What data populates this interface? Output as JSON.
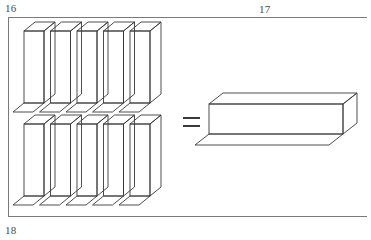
{
  "page": {
    "width": 371,
    "height": 240,
    "background_color": "#ffffff",
    "ink_color": "#3a3a3a",
    "label_color": "#4a4a4a"
  },
  "labels": {
    "top_left": "16",
    "top_center": "17",
    "bottom_left": "18"
  },
  "frame": {
    "name": "page-frame",
    "left": 8,
    "top": 17,
    "right": 367,
    "bottom": 216,
    "stroke": "#7a7a7a",
    "stroke_width": 1,
    "sides_drawn": [
      "top",
      "left",
      "bottom"
    ]
  },
  "figure": {
    "equals_sign": {
      "name": "equals-sign",
      "x": 183,
      "y": 117,
      "bar_width": 17,
      "bar_height": 2,
      "bar_gap": 6
    },
    "tall_prisms": {
      "count": 10,
      "rows": 2,
      "per_row": 5,
      "row_tops": [
        31,
        124
      ],
      "first_left": 24,
      "pitch": 26.5,
      "front_width": 20,
      "front_height": 72,
      "depth_dx": 11,
      "depth_dy": -9
    },
    "long_prism": {
      "name": "long-horizontal-prism",
      "front_left": 209,
      "front_top": 104,
      "front_width": 134,
      "front_height": 30,
      "depth_dx": 14,
      "depth_dy": -11
    }
  },
  "chart_data": {
    "type": "diagram",
    "equation": "10 vertical unit prisms = 1 horizontal ten-prism",
    "left_side": {
      "shape": "tall rectangular prism",
      "count": 10,
      "arrangement": "2 rows of 5"
    },
    "operator": "=",
    "right_side": {
      "shape": "long horizontal rectangular prism",
      "count": 1
    }
  }
}
